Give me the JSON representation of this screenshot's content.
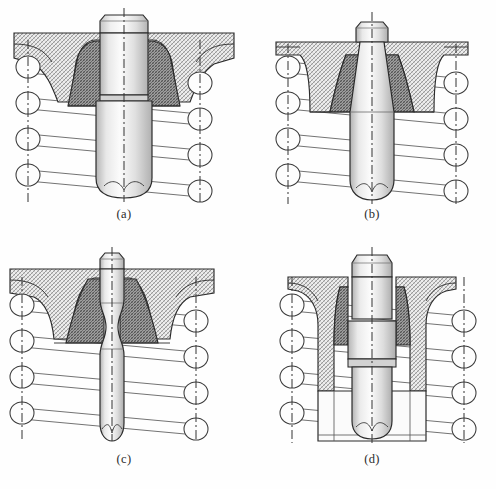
{
  "figure": {
    "panel_count": 4,
    "background_color": "#fefefe",
    "line_color": "#2b2b2b",
    "canvas": {
      "width": 496,
      "height": 489
    }
  },
  "colors": {
    "outline": "#2b2b2b",
    "thin_line": "#555555",
    "centerline": "#333333",
    "hatch_light": "#b9b9b9",
    "hatch_dark": "#6e6e6e",
    "metal_light": "#f2f2f2",
    "metal_mid": "#d9d9d9",
    "metal_dark": "#a8a8a8",
    "seat_fill": "#cfcfcf"
  },
  "panels": [
    {
      "id": "a",
      "label": "(a)",
      "description": "Straight cylindrical valve stem seated in a flanged housing with coil spring",
      "stem_profile": "straight-cylindrical",
      "stem_head": "chamfered-hex",
      "stem_bottom": "rounded-notched",
      "flange": "wide-top-flange",
      "spring_coils_left": 4,
      "spring_coils_right": 4
    },
    {
      "id": "b",
      "label": "(b)",
      "description": "Tapered conical valve stem in a deep drawn housing with coil spring",
      "stem_profile": "tapered-conical",
      "stem_head": "chamfered-hex",
      "stem_bottom": "rounded-notched",
      "flange": "narrow-top-flange",
      "spring_coils_left": 4,
      "spring_coils_right": 4
    },
    {
      "id": "c",
      "label": "(c)",
      "description": "Waisted hourglass valve stem in a wide flanged housing with coil spring",
      "stem_profile": "waisted-hourglass",
      "stem_head": "chamfered-hex",
      "stem_bottom": "rounded-notched",
      "flange": "wide-top-flange",
      "spring_coils_left": 4,
      "spring_coils_right": 4
    },
    {
      "id": "d",
      "label": "(d)",
      "description": "Stepped multi-diameter valve stem inside a sleeve bushing with coil spring",
      "stem_profile": "stepped-multi-diameter",
      "stem_head": "chamfered-hex",
      "stem_bottom": "rounded-notched",
      "flange": "wide-top-flange-with-sleeve",
      "spring_coils_left": 4,
      "spring_coils_right": 4
    }
  ],
  "legend": {
    "hatching_note": "Section hatching indicates cut material",
    "centerline_note": "Dash-dot lines mark spring and stem axes"
  }
}
